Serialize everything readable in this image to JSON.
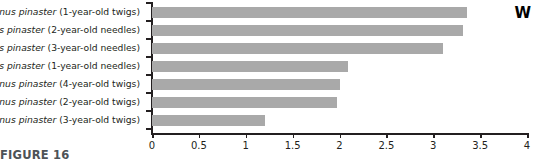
{
  "chart_data": {
    "type": "bar",
    "orientation": "horizontal",
    "title": "",
    "xlabel": "",
    "ylabel": "",
    "xlim": [
      0,
      4
    ],
    "xticks": [
      "0",
      "0.5",
      "1",
      "1.5",
      "2",
      "2.5",
      "3",
      "3.5",
      "4"
    ],
    "xtick_values": [
      0,
      0.5,
      1,
      1.5,
      2,
      2.5,
      3,
      3.5,
      4
    ],
    "grid": false,
    "legend": false,
    "bar_color": "#a9a9a9",
    "axis_color": "#231f20",
    "categories": [
      "Pinus pinaster (1-year-old twigs)",
      "Pinus pinaster (2-year-old needles)",
      "Pinus pinaster (3-year-old needles)",
      "Pinus pinaster (1-year-old needles)",
      "Pinus pinaster (4-year-old twigs)",
      "Pinus pinaster (2-year-old twigs)",
      "Pinus pinaster (3-year-old twigs)"
    ],
    "species_name": "Pinus pinaster",
    "category_suffixes": [
      "(1-year-old twigs)",
      "(2-year-old needles)",
      "(3-year-old needles)",
      "(1-year-old needles)",
      "(4-year-old twigs)",
      "(2-year-old twigs)",
      "(3-year-old twigs)"
    ],
    "values": [
      3.36,
      3.32,
      3.1,
      2.09,
      2.0,
      1.97,
      1.2
    ]
  },
  "annotations": {
    "corner_label": "W"
  },
  "caption": {
    "text": "FIGURE 16"
  }
}
